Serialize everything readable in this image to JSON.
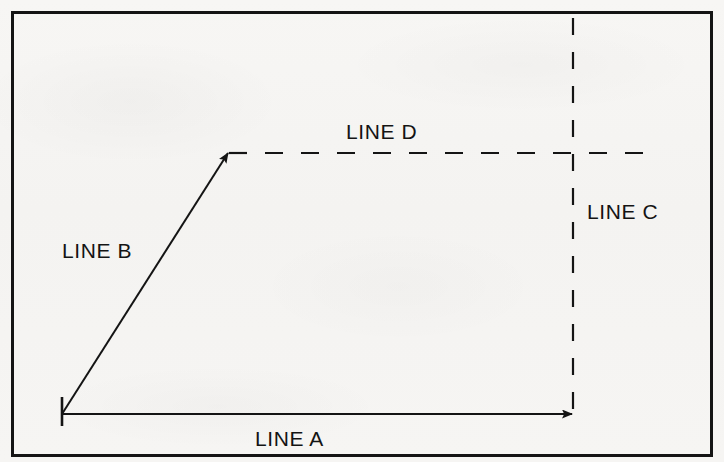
{
  "diagram": {
    "type": "vector-line-diagram",
    "canvas": {
      "width": 724,
      "height": 462
    },
    "background_color": "#f6f5f3",
    "stroke_color": "#141414",
    "border": {
      "name": "diagram-frame",
      "x": 11,
      "y": 11,
      "width": 702,
      "height": 446,
      "stroke_width": 3,
      "style": "solid"
    },
    "origin_tick": {
      "name": "origin-tick-mark",
      "x": 62,
      "y_start": 397,
      "y_end": 426,
      "stroke_width": 2.5
    },
    "lines": [
      {
        "id": "line-a",
        "label": "LINE A",
        "style": "solid",
        "arrow": "end",
        "direction": "horizontal-right",
        "from": {
          "x": 62,
          "y": 414
        },
        "to": {
          "x": 573,
          "y": 414
        },
        "stroke_width": 2,
        "label_position": {
          "x": 255,
          "y": 428
        }
      },
      {
        "id": "line-b",
        "label": "LINE B",
        "style": "solid",
        "arrow": "end",
        "direction": "diagonal-up-right",
        "from": {
          "x": 62,
          "y": 414
        },
        "to": {
          "x": 228,
          "y": 152
        },
        "stroke_width": 2,
        "label_position": {
          "x": 62,
          "y": 240
        }
      },
      {
        "id": "line-c",
        "label": "LINE C",
        "style": "dashed",
        "arrow": "none",
        "direction": "vertical",
        "from": {
          "x": 573,
          "y": 18
        },
        "to": {
          "x": 573,
          "y": 414
        },
        "stroke_width": 2,
        "dash_pattern": "17 17",
        "label_position": {
          "x": 587,
          "y": 201
        }
      },
      {
        "id": "line-d",
        "label": "LINE D",
        "style": "dashed",
        "arrow": "none",
        "direction": "horizontal",
        "from": {
          "x": 228,
          "y": 153
        },
        "to": {
          "x": 661,
          "y": 153
        },
        "stroke_width": 2,
        "dash_pattern": "18 18",
        "label_position": {
          "x": 346,
          "y": 121
        }
      }
    ],
    "labels": {
      "line_a": "LINE A",
      "line_b": "LINE B",
      "line_c": "LINE C",
      "line_d": "LINE D"
    }
  }
}
